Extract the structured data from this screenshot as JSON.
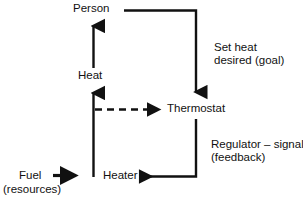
{
  "diagram": {
    "background_color": "#ffffff",
    "stroke_color": "#111111",
    "nodes": [
      {
        "id": "person",
        "label": "Person",
        "x": 73,
        "y": 2
      },
      {
        "id": "heat",
        "label": "Heat",
        "x": 78,
        "y": 69
      },
      {
        "id": "thermostat",
        "label": "Thermostat",
        "x": 167,
        "y": 102
      },
      {
        "id": "heater",
        "label": "Heater",
        "x": 103,
        "y": 169
      },
      {
        "id": "fuel",
        "label": "Fuel",
        "x": 19,
        "y": 169
      },
      {
        "id": "resources",
        "label": "(resources)",
        "x": 3,
        "y": 183
      }
    ],
    "annotations": [
      {
        "id": "set-heat-desired-goal",
        "line1": "Set heat",
        "line2": "desired (goal)",
        "x": 214,
        "y": 41
      },
      {
        "id": "regulator-signal-feedback",
        "line1": "Regulator – signal",
        "line2": "(feedback)",
        "x": 211,
        "y": 138
      }
    ],
    "edges": [
      {
        "id": "heat-to-person",
        "from": "heat",
        "to": "person",
        "style": "solid",
        "arrow": "up"
      },
      {
        "id": "person-to-thermostat",
        "from": "person",
        "to": "thermostat",
        "style": "solid",
        "arrow": "down"
      },
      {
        "id": "heater-to-heat",
        "from": "heater",
        "to": "heat",
        "style": "solid",
        "arrow": "up"
      },
      {
        "id": "heater-to-thermostat",
        "from": "heater",
        "to": "thermostat",
        "style": "dashed",
        "arrow": "right"
      },
      {
        "id": "thermostat-to-heater",
        "from": "thermostat",
        "to": "heater",
        "style": "solid",
        "arrow": "left"
      },
      {
        "id": "fuel-to-heater",
        "from": "fuel",
        "to": "heater",
        "style": "solid",
        "arrow": "right"
      }
    ]
  }
}
